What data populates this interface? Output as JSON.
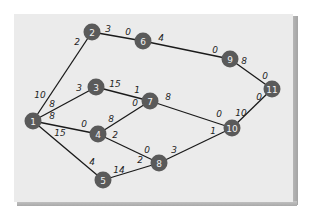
{
  "diagram": {
    "type": "network-graph",
    "nodes": [
      {
        "id": "1",
        "label": "1",
        "x": 33,
        "y": 121
      },
      {
        "id": "2",
        "label": "2",
        "x": 92,
        "y": 32
      },
      {
        "id": "3",
        "label": "3",
        "x": 96,
        "y": 87
      },
      {
        "id": "4",
        "label": "4",
        "x": 98,
        "y": 134
      },
      {
        "id": "5",
        "label": "5",
        "x": 103,
        "y": 180
      },
      {
        "id": "6",
        "label": "6",
        "x": 143,
        "y": 41
      },
      {
        "id": "7",
        "label": "7",
        "x": 150,
        "y": 101
      },
      {
        "id": "8",
        "label": "8",
        "x": 159,
        "y": 163
      },
      {
        "id": "9",
        "label": "9",
        "x": 230,
        "y": 59
      },
      {
        "id": "10",
        "label": "10",
        "x": 232,
        "y": 128
      },
      {
        "id": "11",
        "label": "11",
        "x": 272,
        "y": 89
      }
    ],
    "edges": [
      {
        "from": "1",
        "to": "2",
        "from_label": "10",
        "to_label": "2",
        "fl_x": 40,
        "fl_y": 95,
        "tl_x": 77,
        "tl_y": 42
      },
      {
        "from": "1",
        "to": "3",
        "from_label": "8",
        "to_label": "3",
        "fl_x": 52,
        "fl_y": 104,
        "tl_x": 79,
        "tl_y": 88
      },
      {
        "from": "1",
        "to": "4",
        "from_label": "8",
        "to_label": "0",
        "fl_x": 52,
        "fl_y": 116,
        "tl_x": 84,
        "tl_y": 124
      },
      {
        "from": "1",
        "to": "5",
        "from_label": "15",
        "to_label": "4",
        "fl_x": 60,
        "fl_y": 133,
        "tl_x": 92,
        "tl_y": 162
      },
      {
        "from": "2",
        "to": "6",
        "from_label": "3",
        "to_label": "0",
        "fl_x": 108,
        "fl_y": 29,
        "tl_x": 128,
        "tl_y": 32
      },
      {
        "from": "6",
        "to": "9",
        "from_label": "4",
        "to_label": "0",
        "fl_x": 161,
        "fl_y": 38,
        "tl_x": 215,
        "tl_y": 50
      },
      {
        "from": "3",
        "to": "7",
        "from_label": "15",
        "to_label": "1",
        "fl_x": 115,
        "fl_y": 84,
        "tl_x": 137,
        "tl_y": 90
      },
      {
        "from": "4",
        "to": "7",
        "from_label": "8",
        "to_label": "0",
        "fl_x": 111,
        "fl_y": 119,
        "tl_x": 135,
        "tl_y": 103
      },
      {
        "from": "4",
        "to": "8",
        "from_label": "2",
        "to_label": "0",
        "fl_x": 115,
        "fl_y": 135,
        "tl_x": 147,
        "tl_y": 150
      },
      {
        "from": "5",
        "to": "8",
        "from_label": "14",
        "to_label": "2",
        "fl_x": 119,
        "fl_y": 170,
        "tl_x": 140,
        "tl_y": 160
      },
      {
        "from": "7",
        "to": "10",
        "from_label": "8",
        "to_label": "0",
        "fl_x": 168,
        "fl_y": 97,
        "tl_x": 219,
        "tl_y": 114
      },
      {
        "from": "8",
        "to": "10",
        "from_label": "3",
        "to_label": "1",
        "fl_x": 174,
        "fl_y": 150,
        "tl_x": 213,
        "tl_y": 131
      },
      {
        "from": "9",
        "to": "11",
        "from_label": "8",
        "to_label": "0",
        "fl_x": 244,
        "fl_y": 61,
        "tl_x": 265,
        "tl_y": 76
      },
      {
        "from": "10",
        "to": "11",
        "from_label": "10",
        "to_label": "0",
        "fl_x": 241,
        "fl_y": 113,
        "tl_x": 259,
        "tl_y": 97
      }
    ]
  }
}
